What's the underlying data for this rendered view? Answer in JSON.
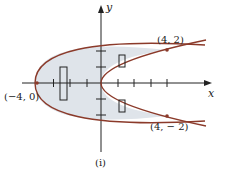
{
  "figure": {
    "caption": "(i)",
    "axes": {
      "x_label": "x",
      "y_label": "y"
    },
    "points": [
      {
        "label": "(4, 2)",
        "x": 4,
        "y": 2
      },
      {
        "label": "(4, − 2)",
        "x": 4,
        "y": -2
      },
      {
        "label": "(−4, 0)",
        "x": -4,
        "y": 0
      }
    ],
    "curves": [
      {
        "name": "outer-parabola",
        "equation": "x = 2y^2 - 4",
        "vertex": [
          -4,
          0
        ]
      },
      {
        "name": "inner-parabola",
        "equation": "x = y^2",
        "vertex": [
          0,
          0
        ]
      }
    ],
    "shaded_region": "between x = 2y^2 - 4 and x = y^2 for -2 <= y <= 2",
    "x_ticks": [
      -4,
      -3,
      -2,
      -1,
      1,
      2,
      3,
      4
    ],
    "y_ticks": [
      -2,
      -1,
      1,
      2
    ],
    "colors": {
      "curve": "#8b3a2a",
      "fill": "#dfe4ea",
      "axis": "#222222"
    }
  }
}
